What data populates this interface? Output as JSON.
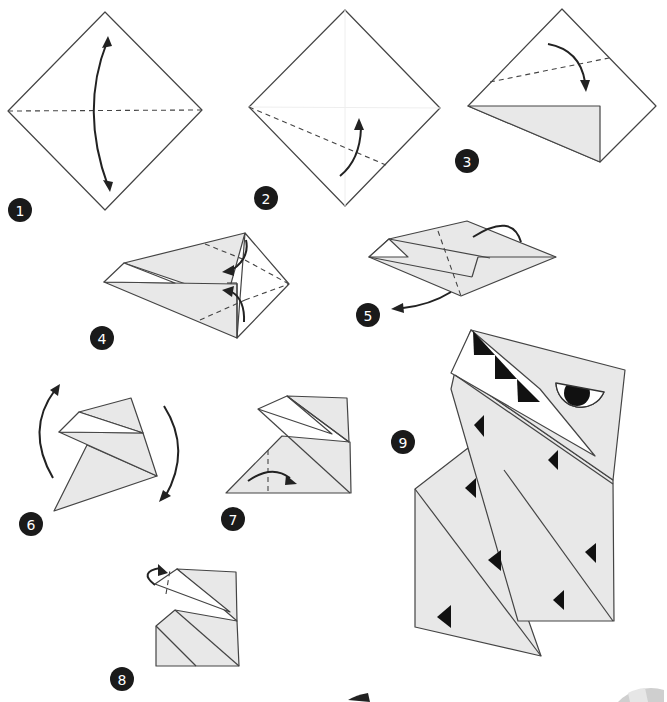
{
  "diagram": {
    "type": "origami-instructions",
    "paper_color": "#e8e8e8",
    "line_color": "#444444",
    "badge_color": "#1a1a1a",
    "steps": [
      {
        "number": "1",
        "label": "1",
        "action": "valley fold along horizontal diagonal and unfold"
      },
      {
        "number": "2",
        "label": "2",
        "action": "fold bottom-left edge up along dashed line"
      },
      {
        "number": "3",
        "label": "3",
        "action": "fold top corner down along dashed line"
      },
      {
        "number": "4",
        "label": "4",
        "action": "fold right flaps inward"
      },
      {
        "number": "5",
        "label": "5",
        "action": "fold behind along dashed line"
      },
      {
        "number": "6",
        "label": "6",
        "action": "rotate model"
      },
      {
        "number": "7",
        "label": "7",
        "action": "fold bottom-left corner along dashed line"
      },
      {
        "number": "8",
        "label": "8",
        "action": "fold tip behind"
      },
      {
        "number": "9",
        "label": "9",
        "action": "finished model with teeth, eye and spots"
      }
    ]
  }
}
